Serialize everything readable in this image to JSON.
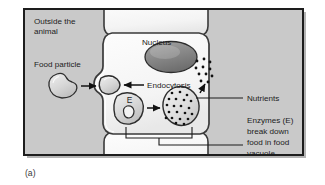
{
  "figure": {
    "caption": "(a)",
    "frame_border_color": "#1d1d1d",
    "outside_fill": "#c9c9c9",
    "cell_fill": "#fbfbfb",
    "membrane_color": "#3a3a3a",
    "nucleus_fill": "#8a8a8a",
    "organelle_fill": "#d8d8d8",
    "dot_color": "#111111",
    "leader_color": "#1c1c1c"
  },
  "labels": {
    "outside_line1": "Outside the",
    "outside_line2": "animal",
    "food_particle": "Food particle",
    "nucleus": "Nucleus",
    "endocytosis": "Endocytosis",
    "nutrients": "Nutrients",
    "enzymes_line1": "Enzymes (E)",
    "enzymes_line2": "break down",
    "enzymes_line3": "food in food",
    "enzymes_line4": "vacuole",
    "enzyme_symbol": "E"
  },
  "structures": {
    "food_particle_name": "food-particle",
    "vesicle_name": "forming-vesicle",
    "lysosome_name": "lysosome",
    "food_vacuole_name": "food-vacuole",
    "nucleus_name": "nucleus",
    "nutrient_dots_count": 11,
    "vacuole_dots_count": 21
  }
}
